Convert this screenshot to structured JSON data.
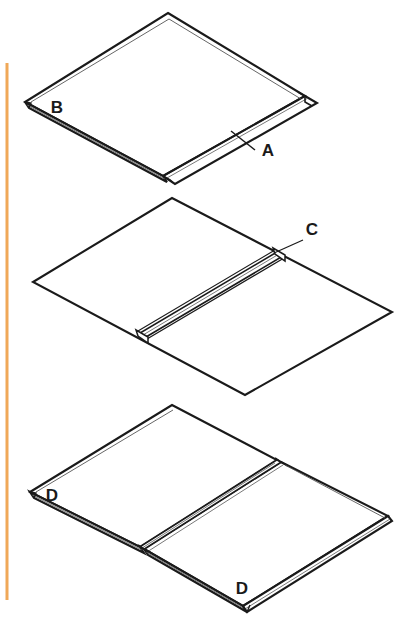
{
  "page": {
    "background_color": "#ffffff",
    "width": 412,
    "height": 633
  },
  "margin_rule": {
    "name": "left-margin-rule",
    "color": "#f0a858",
    "x": 7,
    "y_start": 63,
    "y_end": 600,
    "thickness": 3
  },
  "figures": [
    {
      "id": "figure-top",
      "description": "Single panel shown in isometric view with a raised side rail along its lower-right edge and a thin flange along its lower-left edge.",
      "callouts": [
        {
          "id": "callout-a",
          "label": "A",
          "label_x": 268,
          "label_y": 156,
          "leader_from_x": 255,
          "leader_from_y": 150,
          "leader_to_x": 231,
          "leader_to_y": 131,
          "refers_to": "raised side rail on lower-right edge of panel"
        },
        {
          "id": "callout-b",
          "label": "B",
          "label_x": 57,
          "label_y": 113,
          "leader": false,
          "refers_to": "thin flange edge at left corner of panel"
        }
      ]
    },
    {
      "id": "figure-middle",
      "description": "Flat panel in isometric view with a single raised ridge running diagonally across the middle from lower-left to upper-right.",
      "callouts": [
        {
          "id": "callout-c",
          "label": "C",
          "label_x": 312,
          "label_y": 235,
          "leader_from_x": 303,
          "leader_from_y": 240,
          "leader_to_x": 274,
          "leader_to_y": 253,
          "refers_to": "upper end of the central raised ridge"
        }
      ]
    },
    {
      "id": "figure-bottom",
      "description": "Two panels joined edge to edge in isometric view, with a doubled seam ridge down the middle and flange edges visible along the lower-left and lower-right sides.",
      "callouts": [
        {
          "id": "callout-d-left",
          "label": "D",
          "label_x": 52,
          "label_y": 501,
          "leader": false,
          "refers_to": "flange edge at left corner of left panel"
        },
        {
          "id": "callout-d-bottom",
          "label": "D",
          "label_x": 242,
          "label_y": 594,
          "leader": false,
          "refers_to": "flange edge at bottom corner of right panel"
        }
      ]
    }
  ],
  "style": {
    "line_color": "#1a1a1a",
    "thin_line_color": "#555555",
    "fill_color": "#ffffff",
    "heavy_stroke": 2.1,
    "medium_stroke": 1.3,
    "light_stroke": 0.8
  }
}
